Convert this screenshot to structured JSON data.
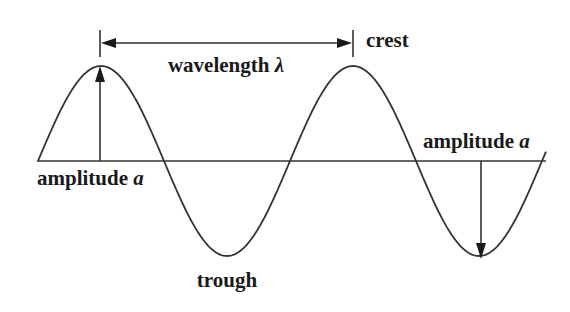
{
  "diagram": {
    "labels": {
      "wavelength": "wavelength",
      "wavelength_symbol": "λ",
      "crest": "crest",
      "trough": "trough",
      "amplitude_left": "amplitude",
      "amplitude_left_symbol": "a",
      "amplitude_right": "amplitude",
      "amplitude_right_symbol": "a"
    },
    "geometry": {
      "baseline_y": 161,
      "wave_start_x": 38,
      "wave_end_x": 546,
      "crests": [
        {
          "x": 100,
          "y": 66
        },
        {
          "x": 352,
          "y": 66
        }
      ],
      "troughs": [
        {
          "x": 228,
          "y": 259
        },
        {
          "x": 481,
          "y": 259
        }
      ],
      "wavelength_px": 252,
      "amplitude_px": 95
    },
    "colors": {
      "line": "#333333",
      "text": "#1a1a1a",
      "background": "#ffffff"
    }
  }
}
